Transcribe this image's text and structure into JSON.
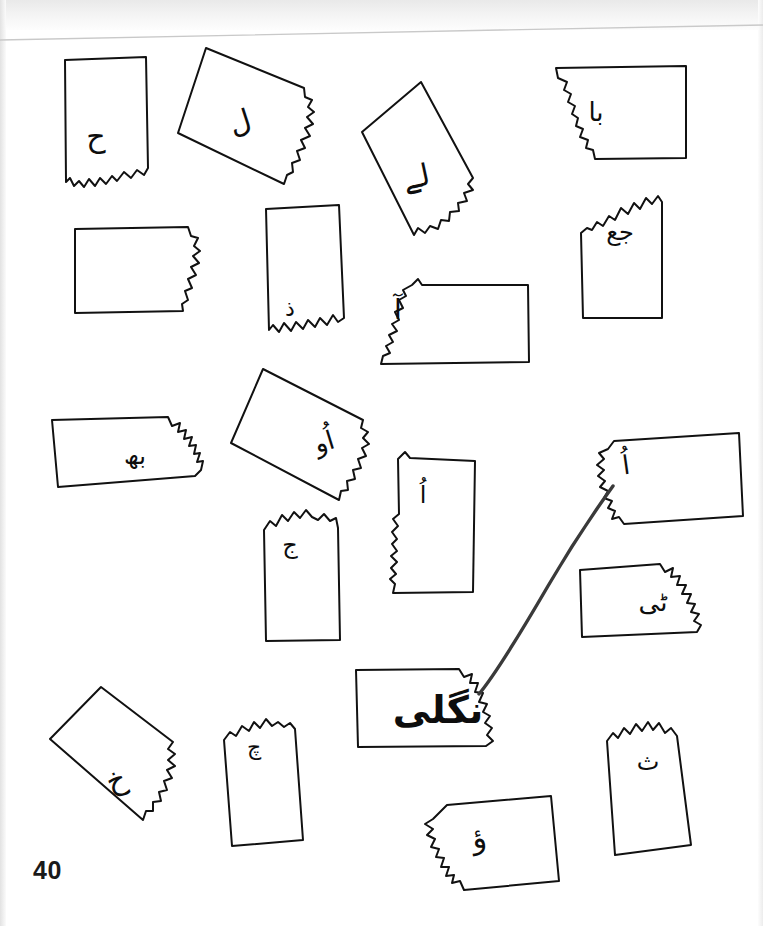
{
  "page": {
    "kind": "scanned-worksheet",
    "page_number": "40",
    "background_color": "#ffffff",
    "ink_color": "#111111",
    "width": 763,
    "height": 926
  },
  "shapes": [
    {
      "id": "card-1",
      "data_name": "letter-card-hay",
      "label": "ح",
      "label_x": 96,
      "label_y": 137,
      "label_size": 30,
      "label_rotation": 0,
      "outline": "M 65,60 L 146,57 L 148,168 L 144,175 L 137,170 L 131,178 L 124,172 L 117,181 L 112,176 L 106,184 L 100,178 L 95,186 L 89,179 L 84,187 L 79,181 L 74,186 L 70,178 L 66,182 Z"
    },
    {
      "id": "card-2",
      "data_name": "letter-card-lam",
      "label": "ل",
      "label_x": 240,
      "label_y": 122,
      "label_size": 30,
      "label_rotation": -18,
      "outline": "M 206,48 L 304,88 L 305,97 L 312,100 L 308,107 L 314,112 L 307,117 L 313,124 L 305,128 L 310,136 L 301,140 L 305,148 L 297,151 L 300,160 L 292,163 L 293,172 L 287,175 L 284,184 L 178,133 Z"
    },
    {
      "id": "card-3",
      "data_name": "letter-card-lay",
      "label": "لے",
      "label_x": 416,
      "label_y": 177,
      "label_size": 30,
      "label_rotation": -12,
      "outline": "M 421,82 L 473,178 L 468,184 L 473,190 L 464,193 L 467,201 L 458,203 L 459,211 L 450,212 L 449,221 L 441,220 L 438,229 L 430,226 L 425,233 L 418,228 L 414,235 L 362,132 Z"
    },
    {
      "id": "card-4",
      "data_name": "letter-card-baa",
      "label": "با",
      "label_x": 596,
      "label_y": 112,
      "label_size": 26,
      "label_rotation": 0,
      "outline": "M 556,68 L 686,66 L 686,158 L 595,159 L 593,150 L 586,148 L 588,140 L 580,137 L 583,129 L 576,126 L 578,118 L 572,114 L 575,106 L 568,102 L 571,94 L 564,90 L 567,82 L 558,78 Z"
    },
    {
      "id": "card-5",
      "data_name": "letter-card-jeem-ain",
      "label": "جع",
      "label_x": 620,
      "label_y": 232,
      "label_size": 24,
      "label_rotation": 0,
      "outline": "M 581,233 L 587,228 L 592,230 L 597,222 L 603,226 L 609,216 L 615,220 L 621,208 L 628,214 L 634,203 L 640,209 L 646,198 L 652,204 L 658,196 L 662,202 L 662,318 L 583,318 Z"
    },
    {
      "id": "card-6",
      "data_name": "letter-card-plain-a",
      "label": "",
      "label_x": 0,
      "label_y": 0,
      "label_size": 0,
      "label_rotation": 0,
      "outline": "M 75,229 L 188,227 L 191,236 L 198,238 L 194,246 L 200,251 L 193,256 L 199,263 L 191,267 L 196,275 L 188,279 L 192,288 L 185,291 L 188,300 L 182,304 L 183,311 L 75,313 Z"
    },
    {
      "id": "card-7",
      "data_name": "letter-card-dal-dot",
      "label": "ذ",
      "label_x": 290,
      "label_y": 309,
      "label_size": 22,
      "label_rotation": 0,
      "outline": "M 266,209 L 339,205 L 344,318 L 338,322 L 333,315 L 327,325 L 320,318 L 315,327 L 308,320 L 303,329 L 296,322 L 291,331 L 284,323 L 279,332 L 273,325 L 269,330 Z"
    },
    {
      "id": "card-8",
      "data_name": "letter-card-alif-madda",
      "label": "آ",
      "label_x": 398,
      "label_y": 310,
      "label_size": 28,
      "label_rotation": 0,
      "outline": "M 412,285 L 418,279 L 422,285 L 528,285 L 529,362 L 381,364 L 383,356 L 390,353 L 386,346 L 393,342 L 389,335 L 397,331 L 392,324 L 399,320 L 395,312 L 403,308 L 399,300 L 406,296 L 403,290 Z"
    },
    {
      "id": "card-9",
      "data_name": "letter-card-noon-dot",
      "label": "بھ",
      "label_x": 135,
      "label_y": 456,
      "label_size": 24,
      "label_rotation": 0,
      "outline": "M 52,420 L 168,417 L 172,426 L 180,423 L 178,432 L 186,430 L 184,439 L 192,437 L 189,446 L 196,445 L 194,454 L 200,453 L 197,462 L 203,461 L 201,470 L 195,476 L 58,487 Z"
    },
    {
      "id": "card-10",
      "data_name": "letter-card-alif-damma-waw",
      "label": "اُو",
      "label_x": 324,
      "label_y": 442,
      "label_size": 26,
      "label_rotation": -17,
      "outline": "M 263,369 L 363,420 L 361,428 L 368,432 L 363,438 L 369,444 L 362,448 L 366,456 L 358,459 L 361,468 L 353,470 L 355,479 L 347,481 L 348,490 L 341,491 L 339,500 L 231,443 Z"
    },
    {
      "id": "card-11",
      "data_name": "letter-card-jeem-dot",
      "label": "ج",
      "label_x": 290,
      "label_y": 545,
      "label_size": 24,
      "label_rotation": 0,
      "outline": "M 264,530 L 270,521 L 276,526 L 282,515 L 288,521 L 294,512 L 300,518 L 306,510 L 312,517 L 318,520 L 324,514 L 330,521 L 336,518 L 338,528 L 340,640 L 266,641 Z"
    },
    {
      "id": "card-12",
      "data_name": "letter-card-alif-slim",
      "label": "اُ",
      "label_x": 423,
      "label_y": 495,
      "label_size": 24,
      "label_rotation": 0,
      "outline": "M 398,459 L 405,452 L 410,458 L 475,461 L 473,592 L 393,593 L 395,584 L 390,579 L 396,574 L 391,568 L 397,562 L 391,556 L 397,551 L 392,544 L 397,539 L 392,532 L 398,526 L 393,519 L 399,514 Z"
    },
    {
      "id": "card-13",
      "data_name": "letter-card-alif-damma-linked",
      "label": "اُ",
      "label_x": 626,
      "label_y": 465,
      "label_size": 26,
      "label_rotation": -8,
      "outline": "M 614,441 L 739,433 L 743,516 L 624,524 L 619,517 L 612,519 L 615,511 L 608,508 L 612,501 L 604,498 L 608,491 L 600,487 L 605,481 L 598,476 L 604,470 L 597,465 L 604,459 L 599,453 L 608,449 Z"
    },
    {
      "id": "card-14",
      "data_name": "letter-card-tte-ye",
      "label": "ٹی",
      "label_x": 653,
      "label_y": 602,
      "label_size": 26,
      "label_rotation": 0,
      "outline": "M 580,570 L 660,564 L 665,572 L 673,568 L 671,577 L 680,576 L 677,585 L 686,585 L 682,594 L 691,594 L 687,603 L 695,604 L 691,612 L 699,614 L 694,621 L 701,625 L 697,632 L 582,637 Z"
    },
    {
      "id": "card-15",
      "data_name": "letter-card-nangli",
      "label": "نگلی",
      "label_x": 438,
      "label_y": 710,
      "label_size": 38,
      "label_rotation": 0,
      "outline": "M 356,670 L 459,669 L 464,677 L 472,674 L 470,683 L 478,683 L 475,692 L 483,693 L 479,702 L 487,704 L 483,712 L 490,716 L 485,723 L 492,728 L 487,735 L 493,741 L 486,746 L 358,747 Z"
    },
    {
      "id": "card-16",
      "data_name": "letter-card-khay",
      "label": "خ",
      "label_x": 116,
      "label_y": 780,
      "label_size": 30,
      "label_rotation": -20,
      "outline": "M 101,687 L 173,742 L 168,749 L 175,754 L 168,760 L 175,766 L 167,770 L 172,778 L 164,781 L 167,790 L 159,792 L 161,801 L 153,802 L 153,811 L 146,811 L 143,820 L 50,739 Z"
    },
    {
      "id": "card-17",
      "data_name": "letter-card-cheem",
      "label": "چ",
      "label_x": 254,
      "label_y": 748,
      "label_size": 22,
      "label_rotation": 0,
      "outline": "M 224,740 L 230,732 L 236,736 L 242,726 L 249,731 L 254,722 L 260,728 L 266,719 L 272,726 L 278,722 L 284,727 L 290,723 L 295,729 L 303,840 L 232,846 Z"
    },
    {
      "id": "card-18",
      "data_name": "letter-card-hamza-waw",
      "label": "ؤ",
      "label_x": 479,
      "label_y": 838,
      "label_size": 30,
      "label_rotation": -8,
      "outline": "M 447,805 L 551,796 L 559,881 L 464,890 L 460,881 L 452,883 L 454,875 L 446,876 L 449,867 L 441,867 L 444,858 L 436,857 L 439,849 L 431,847 L 435,839 L 427,835 L 433,829 L 425,824 L 433,819 Z"
    },
    {
      "id": "card-19",
      "data_name": "letter-card-three-dots",
      "label": "ث",
      "label_x": 648,
      "label_y": 762,
      "label_size": 24,
      "label_rotation": 0,
      "outline": "M 607,741 L 613,733 L 618,738 L 624,728 L 630,734 L 636,724 L 642,731 L 648,722 L 653,730 L 659,723 L 665,733 L 671,728 L 677,736 L 691,845 L 615,855 Z"
    }
  ],
  "connector": {
    "data_name": "pencil-connector-line",
    "description": "hand-drawn curved line linking nangli card to alif-damma card",
    "path": "M 479,694 C 494,676 520,634 548,586 C 576,538 600,504 613,486"
  }
}
